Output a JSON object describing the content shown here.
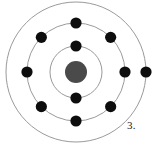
{
  "figure": {
    "label": "3.",
    "label_x": 127,
    "label_y": 120,
    "width": 157,
    "height": 144,
    "background_color": "#ffffff"
  },
  "colors": {
    "nucleus": "#4a4a4a",
    "electron": "#0d0d0d",
    "orbit_stroke": "#9a9a9a",
    "label_text": "#1a1a1a",
    "background": "#ffffff"
  },
  "chart_data": {
    "type": "scatter",
    "title": "",
    "subtitle": "",
    "xlabel": "",
    "ylabel": "",
    "grid": false,
    "legend_position": "none",
    "annotations": [
      "3."
    ],
    "model": "bohr-atom",
    "center": {
      "x": 76,
      "y": 72
    },
    "nucleus": {
      "label": "nucleus",
      "radius": 11,
      "color": "#4a4a4a",
      "cx": 76,
      "cy": 72
    },
    "electron_radius": 5.6,
    "orbit_stroke_width": 1,
    "shell_counts": [
      2,
      8,
      1
    ],
    "total_electrons": 11,
    "electron_configuration": "2-8-1",
    "shells": [
      {
        "name": "shell-1",
        "index": 1,
        "radius": 26,
        "electron_count": 2,
        "electron_angles": [
          90,
          270
        ]
      },
      {
        "name": "shell-2",
        "index": 2,
        "radius": 49,
        "electron_count": 8,
        "electron_angles": [
          0,
          45,
          90,
          135,
          180,
          225,
          270,
          315
        ]
      },
      {
        "name": "shell-3",
        "index": 3,
        "radius": 70,
        "electron_count": 1,
        "electron_angles": [
          0
        ]
      }
    ]
  }
}
